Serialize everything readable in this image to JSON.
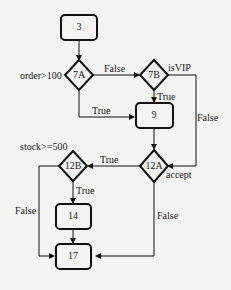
{
  "nodes": {
    "n3": {
      "label": "3"
    },
    "n7A": {
      "label": "7A",
      "condition": "order>100"
    },
    "n7B": {
      "label": "7B",
      "condition": "isVIP"
    },
    "n9": {
      "label": "9"
    },
    "n12A": {
      "label": "12A",
      "condition": "accept"
    },
    "n12B": {
      "label": "12B",
      "condition": "stock>=500"
    },
    "n14": {
      "label": "14"
    },
    "n17": {
      "label": "17"
    }
  },
  "edges": {
    "e7A_7B": "False",
    "e7A_9": "True",
    "e7B_9": "True",
    "e7B_12A": "False",
    "e12A_12B": "True",
    "e12A_17": "False",
    "e12B_14": "True",
    "e12B_17": "False"
  },
  "colors": {
    "stroke": "#111111",
    "background": "#f4f4f2"
  }
}
